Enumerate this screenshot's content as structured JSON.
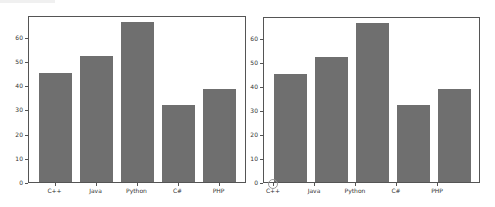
{
  "chart_data": [
    {
      "type": "bar",
      "title": "",
      "xlabel": "",
      "ylabel": "",
      "categories": [
        "C++",
        "Java",
        "Python",
        "C#",
        "PHP"
      ],
      "values": [
        45,
        52,
        66,
        32,
        38.5
      ],
      "ylim": [
        0,
        69
      ],
      "yticks": [
        0,
        10,
        20,
        30,
        40,
        50,
        60
      ],
      "grid": false,
      "legend": null,
      "bar_color": "#6f6f6f",
      "xtick_alignment": "center"
    },
    {
      "type": "bar",
      "title": "",
      "xlabel": "",
      "ylabel": "",
      "categories": [
        "C++",
        "Java",
        "Python",
        "C#",
        "PHP"
      ],
      "values": [
        45,
        52,
        66,
        32,
        38.5
      ],
      "ylim": [
        0,
        69
      ],
      "yticks": [
        0,
        10,
        20,
        30,
        40,
        50,
        60
      ],
      "grid": false,
      "legend": null,
      "bar_color": "#6f6f6f",
      "xtick_alignment": "edge"
    }
  ]
}
